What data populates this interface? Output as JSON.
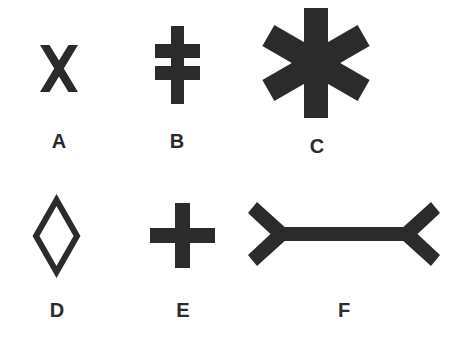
{
  "sheet": {
    "background_color": "#ffffff",
    "ink_color": "#2b2b2b",
    "width": 456,
    "height": 340,
    "rows": 2,
    "columns": 3
  },
  "figures": [
    {
      "label": "A",
      "icon_name": "x-cross-shape",
      "shape": "x-cross",
      "description": "Bold X made of two crossing diagonal bars",
      "filled": true,
      "bbox": {
        "x": 40,
        "y": 45,
        "width": 38,
        "height": 47
      },
      "label_position": {
        "x": 59,
        "y": 141
      }
    },
    {
      "label": "B",
      "icon_name": "double-bar-cross-shape",
      "shape": "patriarchal-cross",
      "description": "Vertical stem crossed by two horizontal bars",
      "filled": true,
      "bbox": {
        "x": 155,
        "y": 26,
        "width": 45,
        "height": 78
      },
      "label_position": {
        "x": 177,
        "y": 141
      }
    },
    {
      "label": "C",
      "icon_name": "six-spoke-asterisk-shape",
      "shape": "asterisk-six-spoke",
      "description": "Six-spoke asterisk star formed by three crossing bars",
      "filled": true,
      "spokes": 6,
      "bbox": {
        "x": 262,
        "y": 8,
        "width": 108,
        "height": 110
      },
      "label_position": {
        "x": 317,
        "y": 146
      }
    },
    {
      "label": "D",
      "icon_name": "diamond-outline-shape",
      "shape": "rhombus-outline",
      "description": "Tall unfilled diamond outline",
      "filled": false,
      "bbox": {
        "x": 33,
        "y": 197,
        "width": 47,
        "height": 78
      },
      "label_position": {
        "x": 57,
        "y": 310
      }
    },
    {
      "label": "E",
      "icon_name": "plus-cross-shape",
      "shape": "plus-cross",
      "description": "Symmetric filled plus sign",
      "filled": true,
      "bbox": {
        "x": 150,
        "y": 203,
        "width": 65,
        "height": 65
      },
      "label_position": {
        "x": 183,
        "y": 310
      }
    },
    {
      "label": "F",
      "icon_name": "muller-lyer-arrow-shape",
      "shape": "muller-lyer-outward-fins",
      "description": "Horizontal bar with outward pointing fins at both ends",
      "filled": true,
      "bbox": {
        "x": 248,
        "y": 200,
        "width": 192,
        "height": 68
      },
      "label_position": {
        "x": 344,
        "y": 310
      }
    }
  ]
}
